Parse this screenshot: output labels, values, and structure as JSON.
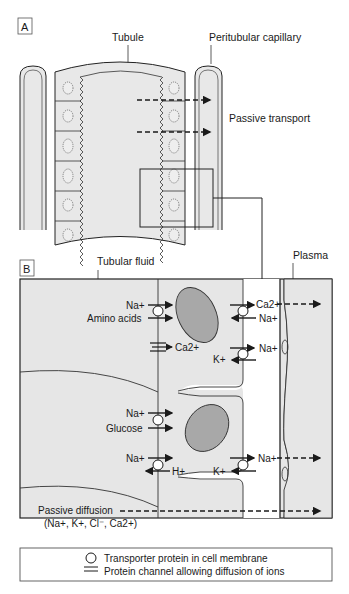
{
  "panel_a": {
    "label": "A",
    "tubule_label": "Tubule",
    "capillary_label": "Peritubular capillary",
    "passive_transport_label": "Passive transport"
  },
  "panel_b": {
    "label": "B",
    "tubular_fluid_label": "Tubular fluid",
    "plasma_label": "Plasma",
    "cell1": {
      "apical": {
        "na": "Na+",
        "amino_acids": "Amino acids",
        "channel_ion": "Ca2+"
      },
      "basolateral": {
        "ca_out": "Ca2+",
        "na_in": "Na+",
        "na_out": "Na+",
        "k_in": "K+"
      }
    },
    "cell2": {
      "apical": {
        "na_glucose": "Na+",
        "glucose": "Glucose",
        "na_h": "Na+",
        "h_out": "H+"
      },
      "basolateral": {
        "k_in": "K+",
        "na_out": "Na+"
      }
    },
    "passive_diffusion": {
      "label": "Passive diffusion",
      "ions": "(Na+, K+, Cl⁻, Ca2+)"
    }
  },
  "legend": {
    "transporter": "Transporter protein in cell membrane",
    "channel": "Protein channel allowing diffusion of ions"
  },
  "colors": {
    "cell_fill": "#e6e6e6",
    "nucleus_fill": "#a8a8a8",
    "line": "#1a1a1a",
    "background": "#ffffff"
  }
}
